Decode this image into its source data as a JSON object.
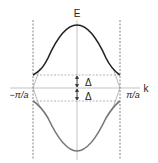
{
  "diagram": {
    "type": "band-structure",
    "axes": {
      "y_label": "E",
      "x_label": "k"
    },
    "zone_boundaries": {
      "left_label": "−π/a",
      "right_label": "π/a"
    },
    "gap_labels": {
      "upper": "Δ",
      "lower": "Δ"
    },
    "bands": [
      {
        "name": "upper-band",
        "description": "inverted cosine-like band above gap",
        "color": "#222222"
      },
      {
        "name": "lower-band",
        "description": "cosine-like band below gap",
        "color": "#777777"
      }
    ],
    "colors": {
      "axis": "#aaaaaa",
      "dashed": "#888888",
      "free_electron": "#999999"
    }
  }
}
